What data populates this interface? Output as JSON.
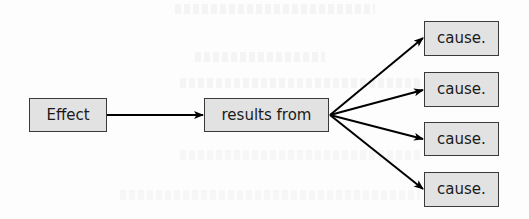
{
  "diagram": {
    "type": "flow",
    "colors": {
      "box_fill": "#e2e2e2",
      "box_border": "#3a3a3a",
      "text": "#1a1a1a",
      "arrow": "#000000",
      "background": "#fdfdfd"
    },
    "nodes": {
      "effect": {
        "label": "Effect"
      },
      "results_from": {
        "label": "results from"
      },
      "causes": [
        {
          "label": "cause."
        },
        {
          "label": "cause."
        },
        {
          "label": "cause."
        },
        {
          "label": "cause."
        }
      ]
    },
    "edges": [
      {
        "from": "effect",
        "to": "results_from"
      },
      {
        "from": "results_from",
        "to": "cause_1"
      },
      {
        "from": "results_from",
        "to": "cause_2"
      },
      {
        "from": "results_from",
        "to": "cause_3"
      },
      {
        "from": "results_from",
        "to": "cause_4"
      }
    ]
  }
}
